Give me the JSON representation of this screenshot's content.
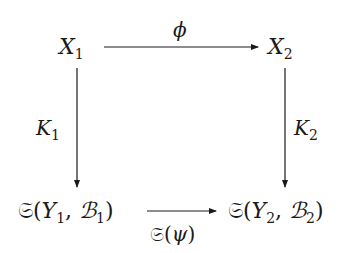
{
  "diagram": {
    "type": "commutative-square",
    "nodes": {
      "top_left": {
        "base": "X",
        "sub": "1"
      },
      "top_right": {
        "base": "X",
        "sub": "2"
      },
      "bottom_left": {
        "op": "𝔖",
        "open": "(",
        "a": "Y",
        "a_sub": "1",
        "sep": ", ",
        "b": "ℬ",
        "b_sub": "1",
        "close": ")"
      },
      "bottom_right": {
        "op": "𝔖",
        "open": "(",
        "a": "Y",
        "a_sub": "2",
        "sep": ", ",
        "b": "ℬ",
        "b_sub": "2",
        "close": ")"
      }
    },
    "arrows": {
      "top": {
        "label": "ϕ",
        "from": "X1",
        "to": "X2"
      },
      "left": {
        "label_base": "K",
        "label_sub": "1",
        "from": "X1",
        "to": "S(Y1,B1)"
      },
      "right": {
        "label_base": "K",
        "label_sub": "2",
        "from": "X2",
        "to": "S(Y2,B2)"
      },
      "bottom": {
        "label_op": "𝔖",
        "label_open": "(",
        "label_arg": "ψ",
        "label_close": ")",
        "from": "S(Y1,B1)",
        "to": "S(Y2,B2)"
      }
    }
  }
}
